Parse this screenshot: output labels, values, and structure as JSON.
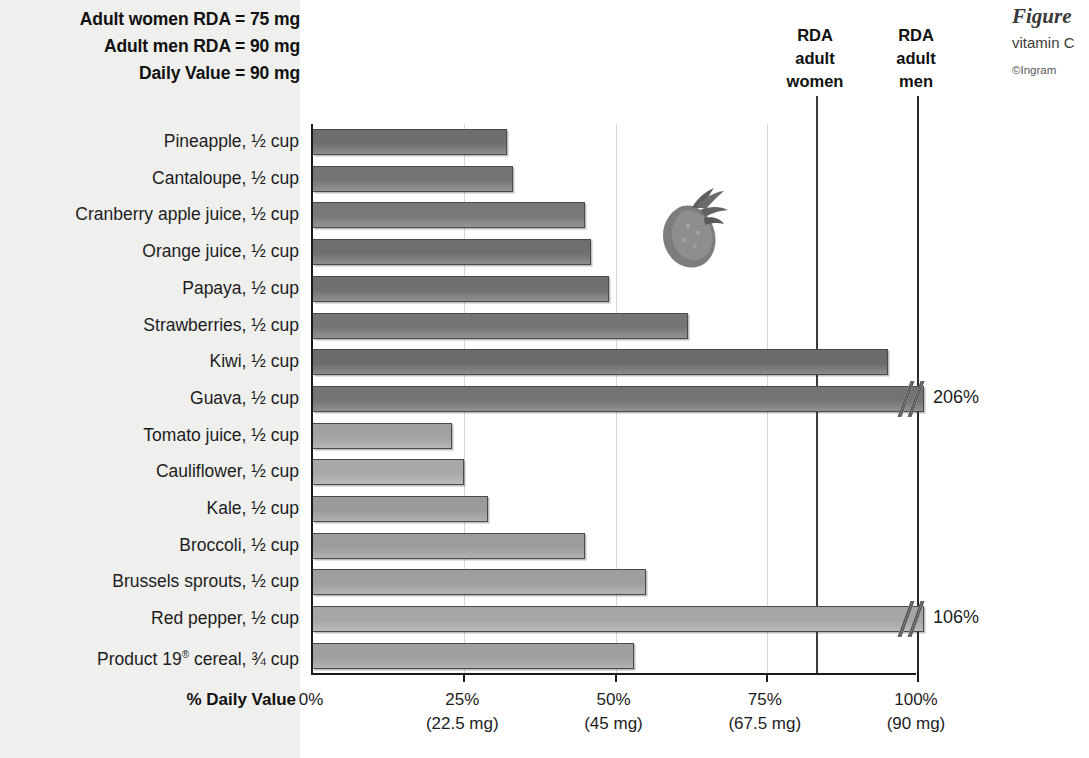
{
  "notes": {
    "women_rda": "Adult women RDA = 75 mg",
    "men_rda": "Adult men RDA = 90 mg",
    "daily_value": "Daily Value = 90 mg"
  },
  "reference_lines": [
    {
      "id": "women",
      "line1": "RDA",
      "line2": "adult",
      "line3": "women",
      "percent": 83.3
    },
    {
      "id": "men",
      "line1": "RDA",
      "line2": "adult",
      "line3": "men",
      "percent": 100
    }
  ],
  "caption": {
    "title": "Figure",
    "body": "vitamin C",
    "credit": "©Ingram"
  },
  "axis_title": "% Daily Value",
  "colors": {
    "bar_dark": "#6e6e6e",
    "bar_mid": "#8a8a8a",
    "bar_light": "#a8a8a8",
    "bar_outline": "#4a4a4a",
    "axis": "#1b1b1b",
    "gridline": "#d6d6d6",
    "refline": "#3c3c3c",
    "panel_background": "#efefed"
  },
  "chart_data": {
    "type": "bar",
    "orientation": "horizontal",
    "xlabel": "% Daily Value",
    "ylabel": "",
    "xlim": [
      0,
      100
    ],
    "grid": true,
    "legend": "none",
    "categories": [
      "Pineapple, ½ cup",
      "Cantaloupe, ½ cup",
      "Cranberry apple juice, ½ cup",
      "Orange juice, ½ cup",
      "Papaya, ½ cup",
      "Strawberries, ½ cup",
      "Kiwi, ½ cup",
      "Guava, ½ cup",
      "Tomato juice, ½ cup",
      "Cauliflower, ½ cup",
      "Kale, ½ cup",
      "Broccoli, ½ cup",
      "Brussels sprouts, ½ cup",
      "Red pepper, ½ cup",
      "Product 19® cereal, ¾ cup"
    ],
    "values": [
      32,
      33,
      45,
      46,
      49,
      62,
      95,
      206,
      23,
      25,
      29,
      45,
      55,
      106,
      53
    ],
    "ticks": [
      {
        "percent": 0,
        "label": "0%",
        "mg": ""
      },
      {
        "percent": 25,
        "label": "25%",
        "mg": "(22.5 mg)"
      },
      {
        "percent": 50,
        "label": "50%",
        "mg": "(45 mg)"
      },
      {
        "percent": 75,
        "label": "75%",
        "mg": "(67.5 mg)"
      },
      {
        "percent": 100,
        "label": "100%",
        "mg": "(90 mg)"
      }
    ],
    "bars": [
      {
        "label_main": "Pineapple, ",
        "frac": "½",
        "label_unit": " cup",
        "value": 32,
        "truncated": false,
        "overflow_label": "",
        "shade": "#6e6e6e"
      },
      {
        "label_main": "Cantaloupe, ",
        "frac": "½",
        "label_unit": " cup",
        "value": 33,
        "truncated": false,
        "overflow_label": "",
        "shade": "#757575"
      },
      {
        "label_main": "Cranberry apple juice, ",
        "frac": "½",
        "label_unit": " cup",
        "value": 45,
        "truncated": false,
        "overflow_label": "",
        "shade": "#787878"
      },
      {
        "label_main": "Orange juice, ",
        "frac": "½",
        "label_unit": " cup",
        "value": 46,
        "truncated": false,
        "overflow_label": "",
        "shade": "#6f6f6f"
      },
      {
        "label_main": "Papaya, ",
        "frac": "½",
        "label_unit": " cup",
        "value": 49,
        "truncated": false,
        "overflow_label": "",
        "shade": "#707070"
      },
      {
        "label_main": "Strawberries, ",
        "frac": "½",
        "label_unit": " cup",
        "value": 62,
        "truncated": false,
        "overflow_label": "",
        "shade": "#757575"
      },
      {
        "label_main": "Kiwi, ",
        "frac": "½",
        "label_unit": " cup",
        "value": 95,
        "truncated": false,
        "overflow_label": "",
        "shade": "#6b6b6b"
      },
      {
        "label_main": "Guava, ",
        "frac": "½",
        "label_unit": " cup",
        "value": 206,
        "truncated": true,
        "overflow_label": "206%",
        "shade": "#737373"
      },
      {
        "label_main": "Tomato juice, ",
        "frac": "½",
        "label_unit": " cup",
        "value": 23,
        "truncated": false,
        "overflow_label": "",
        "shade": "#a2a2a2"
      },
      {
        "label_main": "Cauliflower, ",
        "frac": "½",
        "label_unit": " cup",
        "value": 25,
        "truncated": false,
        "overflow_label": "",
        "shade": "#a8a8a8"
      },
      {
        "label_main": "Kale, ",
        "frac": "½",
        "label_unit": " cup",
        "value": 29,
        "truncated": false,
        "overflow_label": "",
        "shade": "#9a9a9a"
      },
      {
        "label_main": "Broccoli, ",
        "frac": "½",
        "label_unit": " cup",
        "value": 45,
        "truncated": false,
        "overflow_label": "",
        "shade": "#9c9c9c"
      },
      {
        "label_main": "Brussels sprouts, ",
        "frac": "½",
        "label_unit": " cup",
        "value": 55,
        "truncated": false,
        "overflow_label": "",
        "shade": "#9e9e9e"
      },
      {
        "label_main": "Red pepper, ",
        "frac": "½",
        "label_unit": " cup",
        "value": 106,
        "truncated": true,
        "overflow_label": "106%",
        "shade": "#a6a6a6"
      },
      {
        "label_main": "Product 19",
        "frac": "¾",
        "label_unit": " cup",
        "reg": "®",
        "label_mid": " cereal, ",
        "value": 53,
        "truncated": false,
        "overflow_label": "",
        "shade": "#9f9f9f"
      }
    ]
  }
}
